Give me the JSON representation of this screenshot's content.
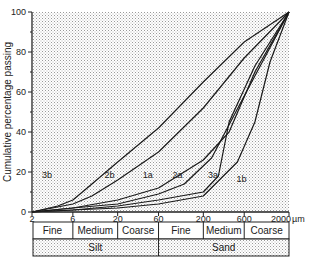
{
  "chart_data": {
    "type": "line",
    "title": "",
    "xlabel": "Particle size (µm, log scale)",
    "ylabel": "Cumulative percentage passing",
    "x_unit": "µm",
    "x_scale": "log",
    "xlim": [
      2,
      2000
    ],
    "ylim": [
      0,
      100
    ],
    "x_ticks": [
      2,
      6,
      20,
      60,
      200,
      600,
      2000
    ],
    "x_tick_labels": [
      "2",
      "6",
      "20",
      "60",
      "200",
      "600",
      "2000"
    ],
    "y_ticks": [
      0,
      20,
      40,
      60,
      80,
      100
    ],
    "y_tick_labels": [
      "0",
      "20",
      "40",
      "60",
      "80",
      "100"
    ],
    "grid": false,
    "background": "stippled grey",
    "legend": "none (curves labelled inline)",
    "series": [
      {
        "name": "3b",
        "x": [
          2,
          4,
          6,
          10,
          20,
          60,
          200,
          600,
          2000
        ],
        "values": [
          0,
          3,
          6,
          14,
          25,
          42,
          65,
          85,
          100
        ],
        "label_at": [
          3,
          17
        ]
      },
      {
        "name": "2b",
        "x": [
          2,
          6,
          10,
          20,
          60,
          200,
          600,
          2000
        ],
        "values": [
          0,
          4,
          8,
          16,
          30,
          52,
          77,
          100
        ],
        "label_at": [
          16,
          17
        ]
      },
      {
        "name": "1a",
        "x": [
          2,
          6,
          20,
          60,
          200,
          400,
          800,
          2000
        ],
        "values": [
          0,
          2,
          6,
          12,
          26,
          40,
          70,
          100
        ],
        "label_at": [
          45,
          17
        ]
      },
      {
        "name": "2a",
        "x": [
          2,
          6,
          20,
          60,
          120,
          250,
          600,
          2000
        ],
        "values": [
          0,
          2,
          4,
          9,
          14,
          27,
          58,
          100
        ],
        "label_at": [
          100,
          17
        ]
      },
      {
        "name": "3a",
        "x": [
          2,
          6,
          20,
          60,
          200,
          300,
          400,
          800,
          2000
        ],
        "values": [
          0,
          1,
          3,
          6,
          10,
          18,
          45,
          73,
          100
        ],
        "label_at": [
          260,
          17
        ]
      },
      {
        "name": "1b",
        "x": [
          2,
          6,
          20,
          60,
          200,
          500,
          800,
          1200,
          2000
        ],
        "values": [
          0,
          1,
          2,
          4,
          8,
          25,
          45,
          75,
          100
        ],
        "label_at": [
          560,
          15
        ]
      }
    ]
  },
  "classification_table": {
    "sub_classes": [
      "Fine",
      "Medium",
      "Coarse",
      "Fine",
      "Medium",
      "Coarse"
    ],
    "main_classes": [
      "Silt",
      "Sand"
    ]
  },
  "unit_label": "µm"
}
